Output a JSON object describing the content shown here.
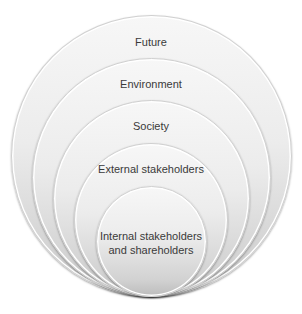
{
  "diagram": {
    "type": "nested-circles",
    "layers": [
      {
        "label": "Future"
      },
      {
        "label": "Environment"
      },
      {
        "label": "Society"
      },
      {
        "label": "External stakeholders"
      },
      {
        "label_line1": "Internal stakeholders",
        "label_line2": "and shareholders"
      }
    ],
    "colors": {
      "fill_top": "#f7f7f7",
      "fill_bottom": "#bcbcbc",
      "rim": "#ffffff",
      "text": "#3a3a3a"
    }
  }
}
